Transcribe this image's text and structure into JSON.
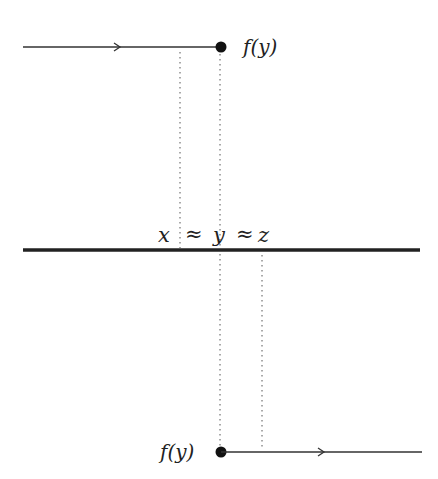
{
  "diagram": {
    "top_label": "f(y)",
    "bottom_label": "f(y)",
    "axis_labels": {
      "x": "x",
      "approx1": "≈",
      "y": "y",
      "approx2": "≈",
      "z": "z"
    },
    "colors": {
      "line": "#333333",
      "dotted": "#555555",
      "point": "#111111"
    }
  }
}
